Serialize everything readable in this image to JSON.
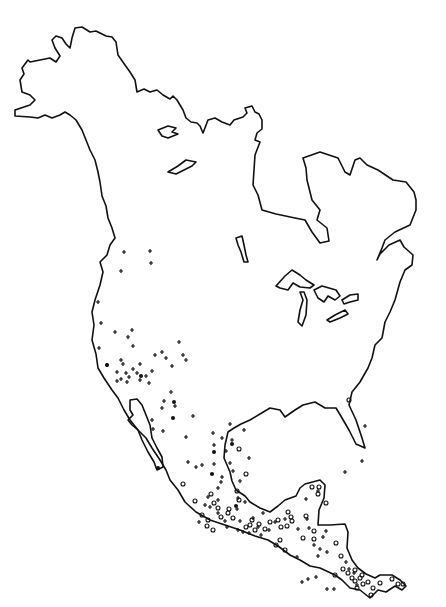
{
  "map": {
    "title": "",
    "region": "North America and Central America",
    "style": {
      "line_color": "#111111",
      "background": "#ffffff"
    },
    "legend": [],
    "marker_types": [
      "plus",
      "circle",
      "dot"
    ],
    "markers": [
      {
        "t": "plus",
        "x": 124,
        "y": 252
      },
      {
        "t": "plus",
        "x": 150,
        "y": 251
      },
      {
        "t": "plus",
        "x": 151,
        "y": 263
      },
      {
        "t": "plus",
        "x": 121,
        "y": 271
      },
      {
        "t": "plus",
        "x": 98,
        "y": 302
      },
      {
        "t": "plus",
        "x": 101,
        "y": 323
      },
      {
        "t": "plus",
        "x": 115,
        "y": 332
      },
      {
        "t": "plus",
        "x": 132,
        "y": 330
      },
      {
        "t": "plus",
        "x": 128,
        "y": 337
      },
      {
        "t": "plus",
        "x": 133,
        "y": 346
      },
      {
        "t": "plus",
        "x": 99,
        "y": 348
      },
      {
        "t": "plus",
        "x": 179,
        "y": 342
      },
      {
        "t": "plus",
        "x": 155,
        "y": 355
      },
      {
        "t": "plus",
        "x": 162,
        "y": 352
      },
      {
        "t": "plus",
        "x": 166,
        "y": 358
      },
      {
        "t": "plus",
        "x": 183,
        "y": 355
      },
      {
        "t": "plus",
        "x": 172,
        "y": 366
      },
      {
        "t": "plus",
        "x": 186,
        "y": 360
      },
      {
        "t": "plus",
        "x": 121,
        "y": 360
      },
      {
        "t": "plus",
        "x": 123,
        "y": 364
      },
      {
        "t": "plus",
        "x": 140,
        "y": 364
      },
      {
        "t": "plus",
        "x": 133,
        "y": 369
      },
      {
        "t": "plus",
        "x": 126,
        "y": 373
      },
      {
        "t": "plus",
        "x": 117,
        "y": 372
      },
      {
        "t": "plus",
        "x": 140,
        "y": 380
      },
      {
        "t": "plus",
        "x": 137,
        "y": 373
      },
      {
        "t": "plus",
        "x": 152,
        "y": 371
      },
      {
        "t": "plus",
        "x": 121,
        "y": 379
      },
      {
        "t": "plus",
        "x": 127,
        "y": 382
      },
      {
        "t": "plus",
        "x": 129,
        "y": 377
      },
      {
        "t": "plus",
        "x": 117,
        "y": 381
      },
      {
        "t": "plus",
        "x": 107,
        "y": 365
      },
      {
        "t": "plus",
        "x": 149,
        "y": 383
      },
      {
        "t": "plus",
        "x": 146,
        "y": 376
      },
      {
        "t": "plus",
        "x": 171,
        "y": 392
      },
      {
        "t": "plus",
        "x": 164,
        "y": 401
      },
      {
        "t": "plus",
        "x": 175,
        "y": 406
      },
      {
        "t": "plus",
        "x": 162,
        "y": 408
      },
      {
        "t": "plus",
        "x": 193,
        "y": 416
      },
      {
        "t": "plus",
        "x": 186,
        "y": 437
      },
      {
        "t": "plus",
        "x": 153,
        "y": 429
      },
      {
        "t": "plus",
        "x": 163,
        "y": 431
      },
      {
        "t": "plus",
        "x": 152,
        "y": 420
      },
      {
        "t": "plus",
        "x": 230,
        "y": 424
      },
      {
        "t": "plus",
        "x": 232,
        "y": 440
      },
      {
        "t": "plus",
        "x": 244,
        "y": 430
      },
      {
        "t": "plus",
        "x": 222,
        "y": 438
      },
      {
        "t": "plus",
        "x": 214,
        "y": 445
      },
      {
        "t": "plus",
        "x": 249,
        "y": 458
      },
      {
        "t": "plus",
        "x": 213,
        "y": 433
      },
      {
        "t": "plus",
        "x": 226,
        "y": 451
      },
      {
        "t": "plus",
        "x": 188,
        "y": 462
      },
      {
        "t": "plus",
        "x": 196,
        "y": 467
      },
      {
        "t": "plus",
        "x": 202,
        "y": 465
      },
      {
        "t": "plus",
        "x": 214,
        "y": 464
      },
      {
        "t": "plus",
        "x": 230,
        "y": 463
      },
      {
        "t": "plus",
        "x": 233,
        "y": 471
      },
      {
        "t": "plus",
        "x": 222,
        "y": 477
      },
      {
        "t": "plus",
        "x": 240,
        "y": 481
      },
      {
        "t": "plus",
        "x": 221,
        "y": 482
      },
      {
        "t": "plus",
        "x": 218,
        "y": 488
      },
      {
        "t": "plus",
        "x": 208,
        "y": 497
      },
      {
        "t": "plus",
        "x": 205,
        "y": 505
      },
      {
        "t": "plus",
        "x": 210,
        "y": 507
      },
      {
        "t": "plus",
        "x": 218,
        "y": 500
      },
      {
        "t": "plus",
        "x": 218,
        "y": 513
      },
      {
        "t": "plus",
        "x": 238,
        "y": 498
      },
      {
        "t": "plus",
        "x": 245,
        "y": 502
      },
      {
        "t": "plus",
        "x": 237,
        "y": 509
      },
      {
        "t": "plus",
        "x": 225,
        "y": 521
      },
      {
        "t": "plus",
        "x": 240,
        "y": 521
      },
      {
        "t": "plus",
        "x": 238,
        "y": 530
      },
      {
        "t": "plus",
        "x": 253,
        "y": 518
      },
      {
        "t": "plus",
        "x": 249,
        "y": 533
      },
      {
        "t": "plus",
        "x": 261,
        "y": 535
      },
      {
        "t": "plus",
        "x": 275,
        "y": 522
      },
      {
        "t": "plus",
        "x": 285,
        "y": 519
      },
      {
        "t": "plus",
        "x": 298,
        "y": 529
      },
      {
        "t": "plus",
        "x": 309,
        "y": 528
      },
      {
        "t": "plus",
        "x": 326,
        "y": 531
      },
      {
        "t": "plus",
        "x": 314,
        "y": 545
      },
      {
        "t": "plus",
        "x": 320,
        "y": 549
      },
      {
        "t": "plus",
        "x": 327,
        "y": 552
      },
      {
        "t": "plus",
        "x": 318,
        "y": 556
      },
      {
        "t": "plus",
        "x": 346,
        "y": 562
      },
      {
        "t": "plus",
        "x": 349,
        "y": 569
      },
      {
        "t": "plus",
        "x": 327,
        "y": 589
      },
      {
        "t": "plus",
        "x": 354,
        "y": 573
      },
      {
        "t": "plus",
        "x": 357,
        "y": 585
      },
      {
        "t": "plus",
        "x": 334,
        "y": 589
      },
      {
        "t": "plus",
        "x": 318,
        "y": 491
      },
      {
        "t": "plus",
        "x": 306,
        "y": 499
      },
      {
        "t": "plus",
        "x": 227,
        "y": 527
      },
      {
        "t": "plus",
        "x": 345,
        "y": 472
      },
      {
        "t": "plus",
        "x": 362,
        "y": 461
      },
      {
        "t": "plus",
        "x": 365,
        "y": 426
      },
      {
        "t": "plus",
        "x": 302,
        "y": 582
      },
      {
        "t": "plus",
        "x": 308,
        "y": 579
      },
      {
        "t": "plus",
        "x": 316,
        "y": 577
      },
      {
        "t": "plus",
        "x": 199,
        "y": 522
      },
      {
        "t": "plus",
        "x": 263,
        "y": 513
      },
      {
        "t": "plus",
        "x": 297,
        "y": 557
      },
      {
        "t": "plus",
        "x": 323,
        "y": 537
      },
      {
        "t": "plus",
        "x": 307,
        "y": 519
      },
      {
        "t": "plus",
        "x": 243,
        "y": 532
      },
      {
        "t": "plus",
        "x": 258,
        "y": 527
      },
      {
        "t": "plus",
        "x": 269,
        "y": 530
      },
      {
        "t": "dot",
        "x": 107,
        "y": 365
      },
      {
        "t": "dot",
        "x": 141,
        "y": 376
      },
      {
        "t": "dot",
        "x": 174,
        "y": 402
      },
      {
        "t": "dot",
        "x": 173,
        "y": 418
      },
      {
        "t": "dot",
        "x": 158,
        "y": 468
      },
      {
        "t": "dot",
        "x": 232,
        "y": 444
      },
      {
        "t": "dot",
        "x": 214,
        "y": 452
      },
      {
        "t": "dot",
        "x": 236,
        "y": 506
      },
      {
        "t": "dot",
        "x": 212,
        "y": 474
      },
      {
        "t": "circle",
        "x": 239,
        "y": 449
      },
      {
        "t": "circle",
        "x": 246,
        "y": 474
      },
      {
        "t": "circle",
        "x": 237,
        "y": 491
      },
      {
        "t": "circle",
        "x": 239,
        "y": 500
      },
      {
        "t": "circle",
        "x": 252,
        "y": 520
      },
      {
        "t": "circle",
        "x": 259,
        "y": 524
      },
      {
        "t": "circle",
        "x": 250,
        "y": 525
      },
      {
        "t": "circle",
        "x": 255,
        "y": 530
      },
      {
        "t": "circle",
        "x": 246,
        "y": 527
      },
      {
        "t": "circle",
        "x": 265,
        "y": 529
      },
      {
        "t": "circle",
        "x": 270,
        "y": 522
      },
      {
        "t": "circle",
        "x": 278,
        "y": 520
      },
      {
        "t": "circle",
        "x": 281,
        "y": 527
      },
      {
        "t": "circle",
        "x": 287,
        "y": 526
      },
      {
        "t": "circle",
        "x": 292,
        "y": 521
      },
      {
        "t": "circle",
        "x": 288,
        "y": 512
      },
      {
        "t": "circle",
        "x": 291,
        "y": 517
      },
      {
        "t": "circle",
        "x": 312,
        "y": 487
      },
      {
        "t": "circle",
        "x": 318,
        "y": 494
      },
      {
        "t": "circle",
        "x": 319,
        "y": 487
      },
      {
        "t": "circle",
        "x": 306,
        "y": 516
      },
      {
        "t": "circle",
        "x": 314,
        "y": 531
      },
      {
        "t": "circle",
        "x": 314,
        "y": 539
      },
      {
        "t": "circle",
        "x": 336,
        "y": 543
      },
      {
        "t": "circle",
        "x": 341,
        "y": 556
      },
      {
        "t": "circle",
        "x": 348,
        "y": 573
      },
      {
        "t": "circle",
        "x": 352,
        "y": 578
      },
      {
        "t": "circle",
        "x": 355,
        "y": 581
      },
      {
        "t": "circle",
        "x": 360,
        "y": 578
      },
      {
        "t": "circle",
        "x": 357,
        "y": 588
      },
      {
        "t": "circle",
        "x": 363,
        "y": 584
      },
      {
        "t": "circle",
        "x": 368,
        "y": 582
      },
      {
        "t": "circle",
        "x": 373,
        "y": 588
      },
      {
        "t": "circle",
        "x": 380,
        "y": 583
      },
      {
        "t": "circle",
        "x": 392,
        "y": 579
      },
      {
        "t": "circle",
        "x": 398,
        "y": 584
      },
      {
        "t": "circle",
        "x": 403,
        "y": 584
      },
      {
        "t": "circle",
        "x": 371,
        "y": 595
      },
      {
        "t": "circle",
        "x": 326,
        "y": 503
      },
      {
        "t": "circle",
        "x": 335,
        "y": 575
      },
      {
        "t": "circle",
        "x": 211,
        "y": 494
      },
      {
        "t": "circle",
        "x": 229,
        "y": 509
      },
      {
        "t": "circle",
        "x": 349,
        "y": 400
      },
      {
        "t": "circle",
        "x": 183,
        "y": 484
      },
      {
        "t": "circle",
        "x": 195,
        "y": 501
      },
      {
        "t": "circle",
        "x": 214,
        "y": 503
      },
      {
        "t": "circle",
        "x": 218,
        "y": 508
      },
      {
        "t": "circle",
        "x": 202,
        "y": 515
      },
      {
        "t": "circle",
        "x": 208,
        "y": 520
      },
      {
        "t": "circle",
        "x": 221,
        "y": 517
      },
      {
        "t": "circle",
        "x": 228,
        "y": 513
      },
      {
        "t": "circle",
        "x": 233,
        "y": 518
      },
      {
        "t": "circle",
        "x": 207,
        "y": 526
      },
      {
        "t": "circle",
        "x": 213,
        "y": 530
      },
      {
        "t": "circle",
        "x": 276,
        "y": 545
      },
      {
        "t": "circle",
        "x": 280,
        "y": 540
      },
      {
        "t": "circle",
        "x": 303,
        "y": 538
      },
      {
        "t": "circle",
        "x": 285,
        "y": 550
      },
      {
        "t": "circle",
        "x": 343,
        "y": 569
      },
      {
        "t": "circle",
        "x": 355,
        "y": 570
      },
      {
        "t": "circle",
        "x": 362,
        "y": 575
      }
    ]
  }
}
